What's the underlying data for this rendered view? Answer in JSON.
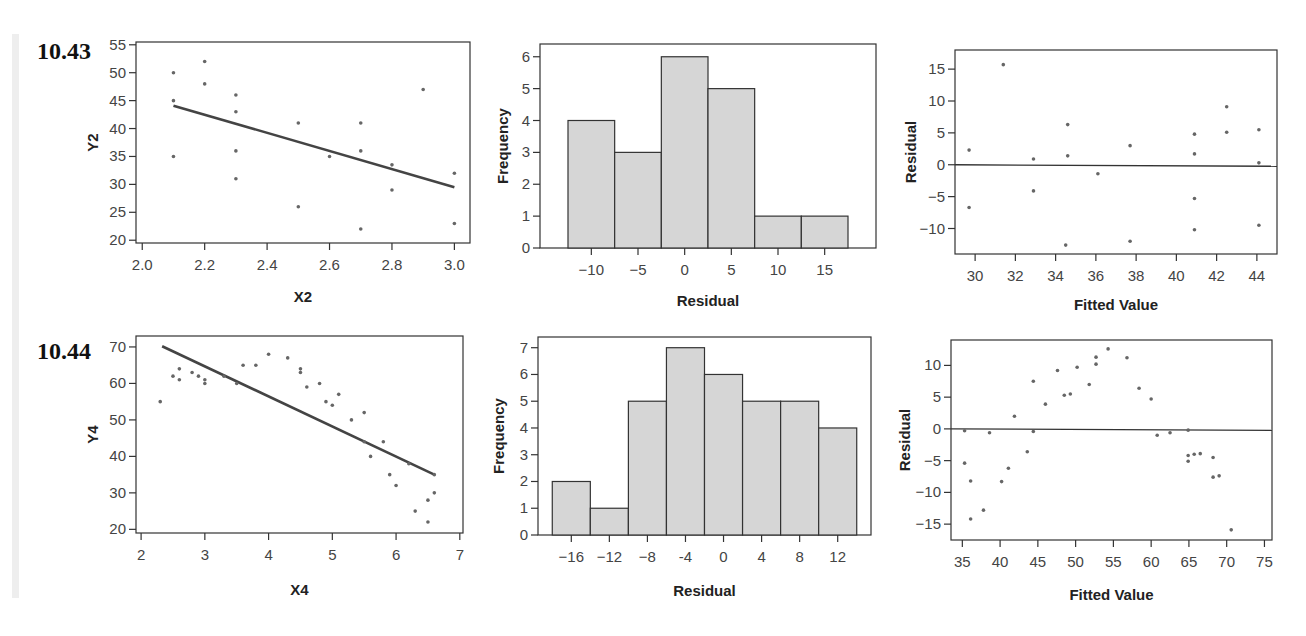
{
  "problems": [
    {
      "label": "10.43"
    },
    {
      "label": "10.44"
    }
  ],
  "chart_data": [
    {
      "id": "p43-scatter",
      "type": "scatter",
      "title": "",
      "xlabel": "X2",
      "ylabel": "Y2",
      "xlim": [
        1.98,
        3.05
      ],
      "ylim": [
        19.5,
        55.5
      ],
      "xticks": [
        2.0,
        2.2,
        2.4,
        2.6,
        2.8,
        3.0
      ],
      "xtick_labels": [
        "2.0",
        "2.2",
        "2.4",
        "2.6",
        "2.8",
        "3.0"
      ],
      "yticks": [
        20,
        25,
        30,
        35,
        40,
        45,
        50,
        55
      ],
      "ytick_labels": [
        "20",
        "25",
        "30",
        "35",
        "40",
        "45",
        "50",
        "55"
      ],
      "points": [
        [
          2.1,
          50
        ],
        [
          2.1,
          45
        ],
        [
          2.1,
          35
        ],
        [
          2.2,
          52
        ],
        [
          2.2,
          48
        ],
        [
          2.3,
          46
        ],
        [
          2.3,
          43
        ],
        [
          2.3,
          36
        ],
        [
          2.3,
          31
        ],
        [
          2.5,
          41
        ],
        [
          2.5,
          26
        ],
        [
          2.6,
          35
        ],
        [
          2.7,
          41
        ],
        [
          2.7,
          36
        ],
        [
          2.7,
          22
        ],
        [
          2.8,
          33.5
        ],
        [
          2.8,
          29
        ],
        [
          2.9,
          47
        ],
        [
          3.0,
          32
        ],
        [
          3.0,
          23
        ]
      ],
      "fit_line": {
        "x": [
          2.1,
          3.0
        ],
        "y": [
          44.1,
          29.5
        ]
      },
      "grid": false
    },
    {
      "id": "p43-hist",
      "type": "bar",
      "title": "",
      "xlabel": "Residual",
      "ylabel": "Frequency",
      "xlim": [
        -15.5,
        20.5
      ],
      "ylim": [
        0,
        6.4
      ],
      "bin_edges": [
        -12.5,
        -7.5,
        -2.5,
        2.5,
        7.5,
        12.5,
        17.5
      ],
      "values": [
        4,
        3,
        6,
        5,
        1,
        1
      ],
      "xticks": [
        -10,
        -5,
        0,
        5,
        10,
        15
      ],
      "xtick_labels": [
        "−10",
        "−5",
        "0",
        "5",
        "10",
        "15"
      ],
      "yticks": [
        0,
        1,
        2,
        3,
        4,
        5,
        6
      ],
      "ytick_labels": [
        "0",
        "1",
        "2",
        "3",
        "4",
        "5",
        "6"
      ],
      "grid": false
    },
    {
      "id": "p43-resid",
      "type": "scatter",
      "title": "",
      "xlabel": "Fitted Value",
      "ylabel": "Residual",
      "xlim": [
        29.0,
        45.0
      ],
      "ylim": [
        -14.0,
        18.0
      ],
      "xticks": [
        30,
        32,
        34,
        36,
        38,
        40,
        42,
        44
      ],
      "xtick_labels": [
        "30",
        "32",
        "34",
        "36",
        "38",
        "40",
        "42",
        "44"
      ],
      "yticks": [
        -10,
        -5,
        0,
        5,
        10,
        15
      ],
      "ytick_labels": [
        "−10",
        "−5",
        "0",
        "5",
        "10",
        "15"
      ],
      "points": [
        [
          29.7,
          2.3
        ],
        [
          29.7,
          -6.7
        ],
        [
          31.4,
          15.7
        ],
        [
          32.9,
          0.9
        ],
        [
          32.9,
          -4.1
        ],
        [
          34.6,
          6.3
        ],
        [
          34.6,
          1.4
        ],
        [
          34.5,
          -12.6
        ],
        [
          36.1,
          -1.4
        ],
        [
          37.7,
          3.0
        ],
        [
          37.7,
          -12.0
        ],
        [
          40.9,
          4.8
        ],
        [
          40.9,
          1.7
        ],
        [
          40.9,
          -5.3
        ],
        [
          40.9,
          -10.2
        ],
        [
          42.5,
          9.1
        ],
        [
          42.5,
          5.1
        ],
        [
          44.1,
          5.5
        ],
        [
          44.1,
          0.3
        ],
        [
          44.1,
          -9.5
        ]
      ],
      "zero_line": 0,
      "grid": false
    },
    {
      "id": "p44-scatter",
      "type": "scatter",
      "title": "",
      "xlabel": "X4",
      "ylabel": "Y4",
      "xlim": [
        1.92,
        7.05
      ],
      "ylim": [
        19,
        73
      ],
      "xticks": [
        2,
        3,
        4,
        5,
        6,
        7
      ],
      "xtick_labels": [
        "2",
        "3",
        "4",
        "5",
        "6",
        "7"
      ],
      "yticks": [
        20,
        30,
        40,
        50,
        60,
        70
      ],
      "ytick_labels": [
        "20",
        "30",
        "40",
        "50",
        "60",
        "70"
      ],
      "points": [
        [
          2.3,
          55
        ],
        [
          2.5,
          62
        ],
        [
          2.6,
          61
        ],
        [
          2.6,
          64
        ],
        [
          2.8,
          63
        ],
        [
          2.9,
          62
        ],
        [
          3.0,
          61
        ],
        [
          3.0,
          60
        ],
        [
          3.3,
          62
        ],
        [
          3.5,
          60
        ],
        [
          3.6,
          65
        ],
        [
          3.8,
          65
        ],
        [
          4.0,
          68
        ],
        [
          4.3,
          67
        ],
        [
          4.5,
          64
        ],
        [
          4.5,
          63
        ],
        [
          4.6,
          59
        ],
        [
          4.8,
          60
        ],
        [
          4.9,
          55
        ],
        [
          5.0,
          54
        ],
        [
          5.1,
          57
        ],
        [
          5.3,
          50
        ],
        [
          5.5,
          52
        ],
        [
          5.5,
          44
        ],
        [
          5.6,
          40
        ],
        [
          5.8,
          44
        ],
        [
          5.9,
          35
        ],
        [
          6.0,
          32
        ],
        [
          6.2,
          38
        ],
        [
          6.3,
          25
        ],
        [
          6.5,
          28
        ],
        [
          6.5,
          22
        ],
        [
          6.6,
          30
        ],
        [
          6.6,
          35
        ]
      ],
      "fit_line": {
        "x": [
          2.33,
          6.6
        ],
        "y": [
          70.2,
          35.0
        ]
      },
      "grid": false
    },
    {
      "id": "p44-hist",
      "type": "bar",
      "title": "",
      "xlabel": "Residual",
      "ylabel": "Frequency",
      "xlim": [
        -19.5,
        15.5
      ],
      "ylim": [
        0,
        7.4
      ],
      "bin_edges": [
        -18,
        -14,
        -10,
        -6,
        -2,
        2,
        6,
        10,
        14
      ],
      "values": [
        2,
        1,
        5,
        7,
        6,
        5,
        5,
        4
      ],
      "xticks": [
        -16,
        -12,
        -8,
        -4,
        0,
        4,
        8,
        12
      ],
      "xtick_labels": [
        "−16",
        "−12",
        "−8",
        "-4",
        "0",
        "4",
        "8",
        "12"
      ],
      "yticks": [
        0,
        1,
        2,
        3,
        4,
        5,
        6,
        7
      ],
      "ytick_labels": [
        "0",
        "1",
        "2",
        "3",
        "4",
        "5",
        "6",
        "7"
      ],
      "grid": false
    },
    {
      "id": "p44-resid",
      "type": "scatter",
      "title": "",
      "xlabel": "Fitted Value",
      "ylabel": "Residual",
      "xlim": [
        33.5,
        76.0
      ],
      "ylim": [
        -17.5,
        14.0
      ],
      "xticks": [
        35,
        40,
        45,
        50,
        55,
        60,
        65,
        70,
        75
      ],
      "xtick_labels": [
        "35",
        "40",
        "45",
        "50",
        "55",
        "60",
        "65",
        "70",
        "75"
      ],
      "yticks": [
        -15,
        -10,
        -5,
        0,
        5,
        10
      ],
      "ytick_labels": [
        "−15",
        "−10",
        "−5",
        "0",
        "5",
        "10"
      ],
      "points": [
        [
          35.3,
          -0.3
        ],
        [
          35.3,
          -5.4
        ],
        [
          36.1,
          -8.2
        ],
        [
          36.1,
          -14.2
        ],
        [
          37.8,
          -12.8
        ],
        [
          38.6,
          -0.6
        ],
        [
          40.2,
          -8.3
        ],
        [
          41.1,
          -6.2
        ],
        [
          41.9,
          2.0
        ],
        [
          43.6,
          -3.6
        ],
        [
          44.4,
          7.5
        ],
        [
          44.4,
          -0.4
        ],
        [
          46.0,
          3.9
        ],
        [
          47.6,
          9.2
        ],
        [
          48.5,
          5.3
        ],
        [
          49.3,
          5.5
        ],
        [
          50.2,
          9.7
        ],
        [
          51.8,
          7.0
        ],
        [
          52.7,
          11.3
        ],
        [
          52.7,
          10.2
        ],
        [
          54.3,
          12.6
        ],
        [
          56.8,
          11.2
        ],
        [
          58.4,
          6.4
        ],
        [
          60.0,
          4.7
        ],
        [
          60.8,
          -1.0
        ],
        [
          62.5,
          -0.6
        ],
        [
          64.9,
          -0.2
        ],
        [
          64.9,
          -4.2
        ],
        [
          64.9,
          -5.1
        ],
        [
          65.7,
          -4.0
        ],
        [
          66.5,
          -3.9
        ],
        [
          68.2,
          -4.5
        ],
        [
          68.2,
          -7.6
        ],
        [
          69.0,
          -7.4
        ],
        [
          70.6,
          -15.9
        ]
      ],
      "zero_line": 0,
      "grid": false
    }
  ]
}
